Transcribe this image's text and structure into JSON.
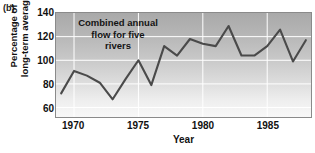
{
  "figure": {
    "panel_label": "(b)"
  },
  "chart_data": {
    "type": "line",
    "title": "",
    "annotation": "Combined annual flow for five rivers",
    "annotation_lines": [
      "Combined annual",
      "flow for five",
      "rivers"
    ],
    "xlabel": "Year",
    "ylabel": "Percentage of long-term average",
    "ylabel_lines": [
      "Percentage of",
      "long-term average"
    ],
    "xlim": [
      1968.6,
      1988.4
    ],
    "ylim": [
      52,
      140
    ],
    "yticks": [
      60,
      80,
      100,
      120,
      140
    ],
    "ytick_labels": [
      "60",
      "80",
      "100",
      "120",
      "140"
    ],
    "xticks": [
      1970,
      1975,
      1980,
      1985
    ],
    "xtick_labels": [
      "1970",
      "1975",
      "1980",
      "1985"
    ],
    "grid": true,
    "grid_color": "#ffffff",
    "line_color": "#4a4a4a",
    "plot_bg_top": "#a9a9a9",
    "plot_bg_bottom": "#f8f8f8",
    "legend": "none",
    "x": [
      1969,
      1970,
      1971,
      1972,
      1973,
      1974,
      1975,
      1976,
      1977,
      1978,
      1979,
      1980,
      1981,
      1982,
      1983,
      1984,
      1985,
      1986,
      1987,
      1988
    ],
    "values": [
      72,
      91,
      87,
      81,
      67,
      84,
      100,
      79,
      112,
      104,
      118,
      114,
      112,
      129,
      104,
      104,
      112,
      126,
      99,
      117
    ],
    "series": [
      {
        "name": "Combined annual flow for five rivers",
        "values": [
          72,
          91,
          87,
          81,
          67,
          84,
          100,
          79,
          112,
          104,
          118,
          114,
          112,
          129,
          104,
          104,
          112,
          126,
          99,
          117
        ]
      }
    ]
  }
}
